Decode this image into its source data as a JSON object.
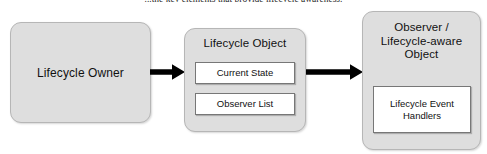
{
  "caption": {
    "text": "...the key elements that provide lifecycle awareness."
  },
  "colors": {
    "node_fill": "#dedede",
    "node_border": "#b6b6b6",
    "subbox_fill": "#ffffff",
    "subbox_border": "#777777",
    "arrow": "#000000",
    "text": "#111111",
    "background": "#ffffff"
  },
  "diagram": {
    "type": "flow",
    "nodes": [
      {
        "id": "lifecycle-owner",
        "title": "Lifecycle Owner",
        "children": []
      },
      {
        "id": "lifecycle-object",
        "title": "Lifecycle Object",
        "children": [
          {
            "id": "current-state",
            "label": "Current State"
          },
          {
            "id": "observer-list",
            "label": "Observer List"
          }
        ]
      },
      {
        "id": "observer-object",
        "title": "Observer /\nLifecycle-aware\nObject",
        "title_lines": [
          "Observer /",
          "Lifecycle-aware",
          "Object"
        ],
        "children": [
          {
            "id": "event-handlers",
            "label": "Lifecycle Event\nHandlers",
            "label_lines": [
              "Lifecycle Event",
              "Handlers"
            ]
          }
        ]
      }
    ],
    "arrows": [
      {
        "id": "arrow-1",
        "from": "lifecycle-owner",
        "to": "lifecycle-object",
        "direction": "right"
      },
      {
        "id": "arrow-2",
        "from": "lifecycle-object",
        "to": "observer-object",
        "direction": "right"
      }
    ]
  }
}
